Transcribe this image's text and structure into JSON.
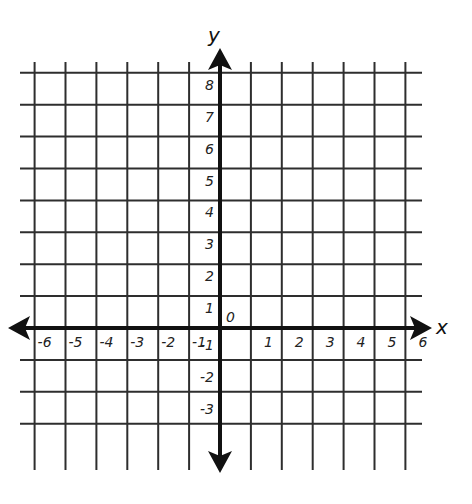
{
  "diagram": {
    "type": "coordinate-plane",
    "x_axis": {
      "name": "x",
      "min": -6,
      "max": 6,
      "tick_labels": [
        "-6",
        "-5",
        "-4",
        "-3",
        "-2",
        "-1",
        "1",
        "2",
        "3",
        "4",
        "5",
        "6"
      ]
    },
    "y_axis": {
      "name": "y",
      "min": -3,
      "max": 8,
      "tick_labels": [
        "8",
        "7",
        "6",
        "5",
        "4",
        "3",
        "2",
        "1",
        "-1",
        "-2",
        "-3"
      ]
    },
    "origin_label": "0",
    "colors": {
      "grid": "#2e2e2e",
      "axis": "#111111",
      "background": "#ffffff"
    }
  }
}
